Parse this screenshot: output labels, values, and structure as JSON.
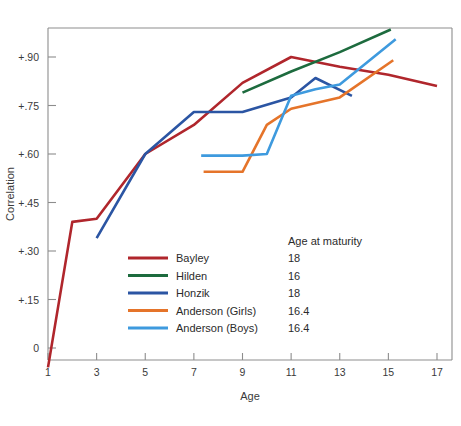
{
  "chart_data": {
    "type": "line",
    "title": "",
    "xlabel": "Age",
    "ylabel": "Correlation",
    "xlim": [
      0.1,
      17.5
    ],
    "ylim": [
      -0.09,
      1.02
    ],
    "grid": false,
    "legend_position": "inside-bottom-left",
    "x_ticks": [
      "1",
      "3",
      "5",
      "7",
      "9",
      "11",
      "13",
      "15",
      "17"
    ],
    "x_tick_values": [
      1,
      3,
      5,
      7,
      9,
      11,
      13,
      15,
      17
    ],
    "y_ticks": [
      "0",
      "+.15",
      "+.30",
      "+.45",
      "+.60",
      "+.75",
      "+.90"
    ],
    "y_tick_values": [
      0,
      0.15,
      0.3,
      0.45,
      0.6,
      0.75,
      0.9
    ],
    "legend_header": "Age at maturity",
    "series": [
      {
        "name": "Bayley",
        "color": "#b0262c",
        "age_at_maturity": "18",
        "points": [
          [
            1,
            -0.06
          ],
          [
            2,
            0.39
          ],
          [
            3,
            0.4
          ],
          [
            5,
            0.6
          ],
          [
            7,
            0.69
          ],
          [
            9,
            0.82
          ],
          [
            11,
            0.9
          ],
          [
            13,
            0.87
          ],
          [
            15,
            0.845
          ],
          [
            17,
            0.81
          ]
        ]
      },
      {
        "name": "Hilden",
        "color": "#1d6b3e",
        "age_at_maturity": "16",
        "points": [
          [
            9,
            0.79
          ],
          [
            11,
            0.855
          ],
          [
            13,
            0.915
          ],
          [
            15.1,
            0.985
          ]
        ]
      },
      {
        "name": "Honzik",
        "color": "#2b55a3",
        "age_at_maturity": "18",
        "points": [
          [
            3,
            0.34
          ],
          [
            5,
            0.6
          ],
          [
            7,
            0.73
          ],
          [
            9,
            0.73
          ],
          [
            11,
            0.775
          ],
          [
            12,
            0.835
          ],
          [
            13.5,
            0.78
          ]
        ]
      },
      {
        "name": "Anderson (Girls)",
        "color": "#e5742a",
        "age_at_maturity": "16.4",
        "points": [
          [
            7.4,
            0.545
          ],
          [
            9,
            0.545
          ],
          [
            10,
            0.69
          ],
          [
            11,
            0.74
          ],
          [
            13,
            0.775
          ],
          [
            15.2,
            0.89
          ]
        ]
      },
      {
        "name": "Anderson (Boys)",
        "color": "#3e9ade",
        "age_at_maturity": "16.4",
        "points": [
          [
            7.3,
            0.595
          ],
          [
            9,
            0.595
          ],
          [
            10,
            0.6
          ],
          [
            11,
            0.78
          ],
          [
            12,
            0.8
          ],
          [
            13,
            0.815
          ],
          [
            15.3,
            0.955
          ]
        ]
      }
    ]
  }
}
